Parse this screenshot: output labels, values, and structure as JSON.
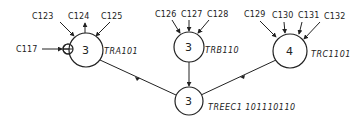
{
  "diagram": {
    "type": "tree",
    "nodes": [
      {
        "id": "tra",
        "name": "TRA101",
        "count": "3",
        "inputs": [
          "C123",
          "C124",
          "C125"
        ],
        "side_input": "C117"
      },
      {
        "id": "trb",
        "name": "TRB110",
        "count": "3",
        "inputs": [
          "C126",
          "C127",
          "C128"
        ]
      },
      {
        "id": "trc",
        "name": "TRC1101",
        "count": "4",
        "inputs": [
          "C129",
          "C130",
          "C131",
          "C132"
        ]
      },
      {
        "id": "root",
        "name": "TREEC1 101110110",
        "count": "3"
      }
    ],
    "edges": [
      {
        "from": "TRA101",
        "to": "TREEC1"
      },
      {
        "from": "TRB110",
        "to": "TREEC1"
      },
      {
        "from": "TRC1101",
        "to": "TREEC1"
      }
    ],
    "colors": {
      "stroke": "#222222",
      "background": "#ffffff"
    }
  }
}
